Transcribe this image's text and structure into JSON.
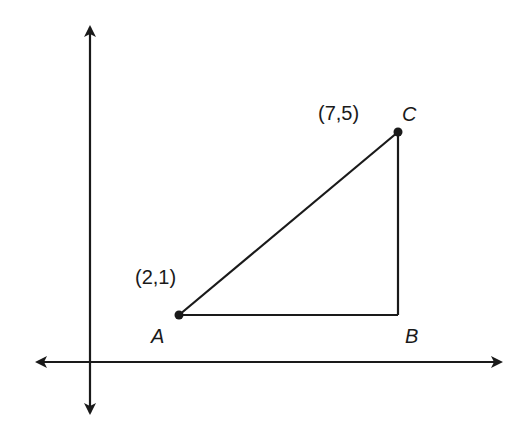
{
  "diagram": {
    "type": "coordinate-plane-triangle",
    "points": {
      "A": {
        "label": "A",
        "coord_label": "(2,1)",
        "x": 2,
        "y": 1
      },
      "B": {
        "label": "B"
      },
      "C": {
        "label": "C",
        "coord_label": "(7,5)",
        "x": 7,
        "y": 5
      }
    },
    "colors": {
      "stroke": "#1a1a1a",
      "background": "#ffffff"
    }
  }
}
